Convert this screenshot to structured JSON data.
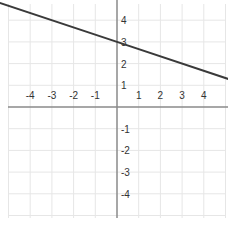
{
  "chart_data": {
    "type": "line",
    "title": "",
    "xlabel": "",
    "ylabel": "",
    "xlim": [
      -5.4,
      5.2
    ],
    "ylim": [
      -5,
      5
    ],
    "grid": true,
    "legend": null,
    "x_ticks": [
      "-4",
      "-3",
      "-2",
      "-1",
      "1",
      "2",
      "3",
      "4"
    ],
    "y_ticks": [
      "4",
      "3",
      "2",
      "1",
      "-1",
      "-2",
      "-3",
      "-4"
    ],
    "series": [
      {
        "name": "line",
        "equation": "y = -x/3 + 3",
        "x": [
          -5.4,
          0,
          5.2
        ],
        "y": [
          4.8,
          3,
          1.27
        ]
      }
    ]
  },
  "colors": {
    "grid": "#e6e6e6",
    "axis": "#8a8a8a",
    "line": "#3a3a3a",
    "text": "#333333"
  }
}
